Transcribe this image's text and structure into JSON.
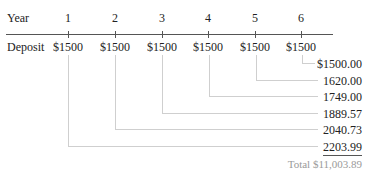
{
  "timeline": {
    "row_labels": {
      "year": "Year",
      "deposit": "Deposit"
    },
    "years": [
      "1",
      "2",
      "3",
      "4",
      "5",
      "6"
    ],
    "deposits": [
      "$1500",
      "$1500",
      "$1500",
      "$1500",
      "$1500",
      "$1500"
    ]
  },
  "future_values": [
    "$1500.00",
    "1620.00",
    "1749.00",
    "1889.57",
    "2040.73",
    "2203.99"
  ],
  "total": "Total $11,003.89",
  "colors": {
    "axis": "#555555",
    "connector": "#cfcfcf",
    "total_text": "#9a9a9a"
  }
}
